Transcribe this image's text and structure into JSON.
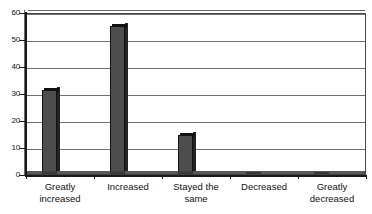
{
  "chart_data": {
    "type": "bar",
    "title": "",
    "subtitle": "",
    "xlabel": "",
    "ylabel": "",
    "categories": [
      "Greatly\nincreased",
      "Increased",
      "Stayed the\nsame",
      "Decreased",
      "Greatly\ndecreased"
    ],
    "values": [
      31,
      55,
      14.5,
      0,
      0
    ],
    "ylim": [
      0,
      60
    ],
    "yticks": [
      0,
      10,
      20,
      30,
      40,
      50,
      60
    ],
    "ytick_labels": [
      "0",
      "10",
      "20",
      "30",
      "40",
      "50",
      "60"
    ],
    "grid": "horizontal",
    "legend": "none",
    "series": [
      {
        "name": "",
        "values": [
          31,
          55,
          14.5,
          0,
          0
        ]
      }
    ],
    "style": {
      "bar_face_color": "#4d4d4d",
      "bar_edge_color": "#111111",
      "bar_top_color": "#111111",
      "plot_background": "#ffffff",
      "gridline_color": "#707070",
      "axis_color": "#1a1a1a",
      "frame_color": "#4a4a4a",
      "effect": "3d"
    }
  }
}
